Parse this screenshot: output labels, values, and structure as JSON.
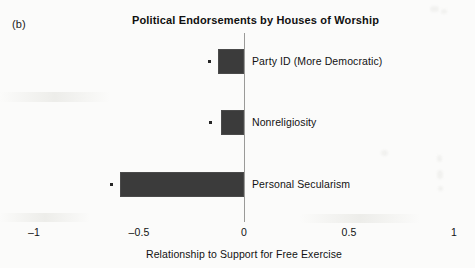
{
  "panel": {
    "label": "(b)"
  },
  "chart_data": {
    "type": "bar",
    "orientation": "horizontal",
    "title": "Political Endorsements by Houses of Worship",
    "xlabel": "Relationship to Support for Free Exercise",
    "ylabel": "",
    "xlim": [
      -1,
      1
    ],
    "xticks": [
      -1,
      -0.5,
      0,
      0.5,
      1
    ],
    "xtick_labels": [
      "–1",
      "–0.5",
      "0",
      "0.5",
      "1"
    ],
    "grid": false,
    "legend": null,
    "zero_reference_line": 0,
    "bar_color": "#3b3b3b",
    "axis_color": "#9a9a98",
    "categories": [
      "Party ID (More Democratic)",
      "Nonreligiosity",
      "Personal Secularism"
    ],
    "values": [
      -0.125,
      -0.11,
      -0.59
    ],
    "ci_lower": [
      -0.165,
      -0.16,
      -0.63
    ],
    "points": [
      {
        "category": "Party ID (More Democratic)",
        "value": -0.125,
        "ci_lower": -0.165
      },
      {
        "category": "Nonreligiosity",
        "value": -0.11,
        "ci_lower": -0.16
      },
      {
        "category": "Personal Secularism",
        "value": -0.59,
        "ci_lower": -0.63
      }
    ]
  }
}
